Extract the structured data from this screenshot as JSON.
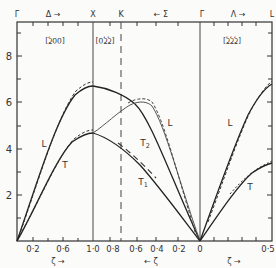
{
  "chart_data": {
    "type": "line",
    "title": "",
    "xlabel": "ζ",
    "ylabel": "",
    "ylim": [
      0,
      9.5
    ],
    "y_ticks": [
      "2",
      "4",
      "6",
      "8"
    ],
    "top_labels": [
      "Γ",
      "Δ →",
      "X",
      "K",
      "← Σ",
      "Γ",
      "Λ →",
      "L"
    ],
    "direction_labels": [
      "[00ζ]",
      "[ζζ0]",
      "[ζζζ]"
    ],
    "bottom_tick_labels": [
      "0·2",
      "0·6",
      "1·0",
      "0·8",
      "0·6",
      "0·4",
      "0·2",
      "0",
      "0·5"
    ],
    "bottom_axis_labels": [
      "ζ →",
      "← ζ",
      "ζ →"
    ],
    "branch_labels": [
      "L",
      "T",
      "T2",
      "T1",
      "L",
      "L",
      "T"
    ],
    "segments": [
      {
        "name": "Δ [00ζ]",
        "x": [
          0,
          0.2,
          0.4,
          0.6,
          0.8,
          1.0
        ],
        "series": [
          {
            "name": "L",
            "values": [
              0,
              2.6,
              4.6,
              5.9,
              6.5,
              6.7
            ]
          },
          {
            "name": "T",
            "values": [
              0,
              1.7,
              3.1,
              4.0,
              4.5,
              4.65
            ]
          }
        ]
      },
      {
        "name": "Σ [ζζ0]",
        "x": [
          1.0,
          0.8,
          0.6,
          0.4,
          0.2,
          0
        ],
        "series": [
          {
            "name": "L",
            "values": [
              6.7,
              6.2,
              5.9,
              4.5,
              2.5,
              0
            ]
          },
          {
            "name": "T2",
            "values": [
              4.65,
              5.4,
              5.9,
              4.3,
              2.3,
              0
            ]
          },
          {
            "name": "T1",
            "values": [
              4.65,
              4.0,
              3.2,
              2.2,
              1.1,
              0
            ]
          }
        ]
      },
      {
        "name": "Λ [ζζζ]",
        "x": [
          0,
          0.1,
          0.2,
          0.3,
          0.4,
          0.5
        ],
        "series": [
          {
            "name": "L",
            "values": [
              0,
              2.4,
              4.2,
              5.5,
              6.3,
              6.8
            ]
          },
          {
            "name": "T",
            "values": [
              0,
              1.3,
              2.2,
              2.8,
              3.1,
              3.3
            ]
          }
        ]
      }
    ],
    "grid": false,
    "legend": "none"
  }
}
